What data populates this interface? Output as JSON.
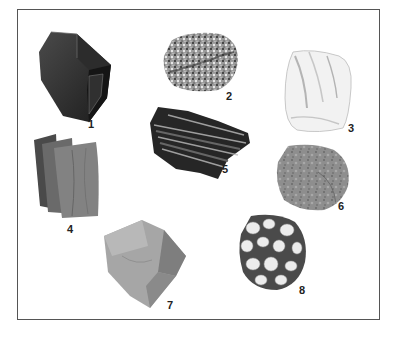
{
  "figure": {
    "specimens": [
      {
        "number": "1",
        "appearance": "dark, glossy faceted crystal block"
      },
      {
        "number": "2",
        "appearance": "speckled granular rock"
      },
      {
        "number": "3",
        "appearance": "white streaked rounded rock"
      },
      {
        "number": "4",
        "appearance": "stacked brown-grey slabs"
      },
      {
        "number": "5",
        "appearance": "dark fibrous striated prism cluster"
      },
      {
        "number": "6",
        "appearance": "grey mottled rough rock"
      },
      {
        "number": "7",
        "appearance": "light grey angular faceted rock"
      },
      {
        "number": "8",
        "appearance": "conglomerate with white rounded pebbles in dark matrix"
      }
    ]
  },
  "colors": {
    "frame_border": "#555555",
    "background": "#ffffff"
  }
}
